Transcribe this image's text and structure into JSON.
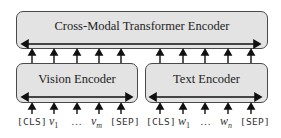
{
  "diagram": {
    "top_encoder": {
      "label": "Cross-Modal Transformer Encoder"
    },
    "vision_encoder": {
      "label": "Vision Encoder"
    },
    "text_encoder": {
      "label": "Text Encoder"
    },
    "vision_inputs": {
      "cls": "[CLS]",
      "v1": "v",
      "v1_sub": "1",
      "ellipsis": "…",
      "vm": "v",
      "vm_sub": "m",
      "sep": "[SEP]"
    },
    "text_inputs": {
      "cls": "[CLS]",
      "w1": "w",
      "w1_sub": "1",
      "ellipsis": "…",
      "wn": "w",
      "wn_sub": "n",
      "sep": "[SEP]"
    },
    "colors": {
      "box_fill": "#e3e3e3",
      "box_border": "#4a4a4a",
      "arrow": "#111111"
    }
  }
}
